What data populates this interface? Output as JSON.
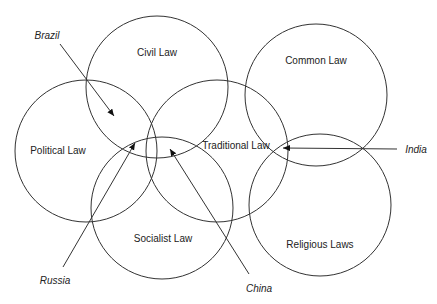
{
  "diagram": {
    "type": "venn-overlap",
    "circles": [
      {
        "id": "civil",
        "label": "Civil Law",
        "cx": 157,
        "cy": 87,
        "r": 71,
        "label_x": 157,
        "label_y": 56
      },
      {
        "id": "common",
        "label": "Common Law",
        "cx": 316,
        "cy": 95,
        "r": 71,
        "label_x": 316,
        "label_y": 64
      },
      {
        "id": "political",
        "label": "Political Law",
        "cx": 86,
        "cy": 151,
        "r": 71,
        "label_x": 58,
        "label_y": 154
      },
      {
        "id": "traditional",
        "label": "Traditional Law",
        "cx": 217,
        "cy": 151,
        "r": 71,
        "label_x": 236,
        "label_y": 149
      },
      {
        "id": "socialist",
        "label": "Socialist Law",
        "cx": 162,
        "cy": 208,
        "r": 71,
        "label_x": 163,
        "label_y": 242
      },
      {
        "id": "religious",
        "label": "Religious Laws",
        "cx": 320,
        "cy": 205,
        "r": 71,
        "label_x": 320,
        "label_y": 248
      }
    ],
    "countries": [
      {
        "id": "brazil",
        "label": "Brazil",
        "label_x": 47,
        "label_y": 39,
        "x1": 60,
        "y1": 44,
        "x2": 114,
        "y2": 116
      },
      {
        "id": "russia",
        "label": "Russia",
        "label_x": 55,
        "label_y": 284,
        "x1": 63,
        "y1": 267,
        "x2": 135,
        "y2": 143
      },
      {
        "id": "china",
        "label": "China",
        "label_x": 259,
        "label_y": 292,
        "x1": 249,
        "y1": 274,
        "x2": 170,
        "y2": 149
      },
      {
        "id": "india",
        "label": "India",
        "label_x": 416,
        "label_y": 153,
        "x1": 397,
        "y1": 149,
        "x2": 283,
        "y2": 148
      }
    ],
    "stroke_color": "#333333",
    "background": "#ffffff"
  }
}
